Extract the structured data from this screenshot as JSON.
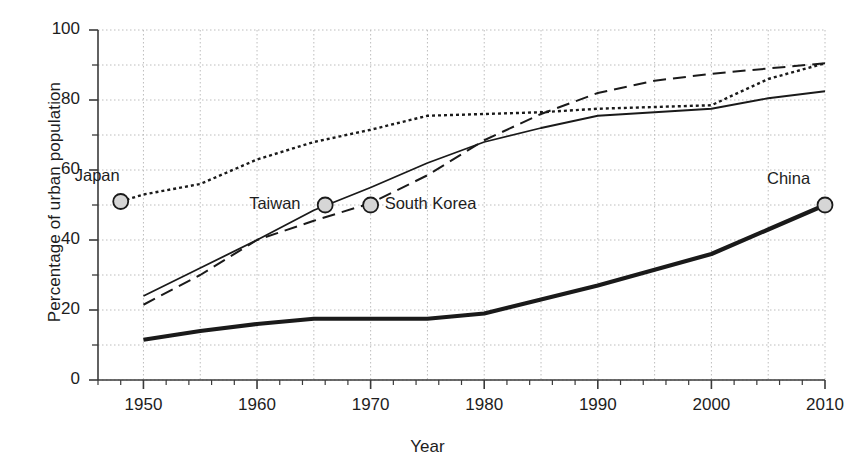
{
  "chart_data": {
    "type": "line",
    "title": "",
    "xlabel": "Year",
    "ylabel": "Percentage of urban population",
    "xlim": [
      1946,
      2010
    ],
    "ylim": [
      0,
      100
    ],
    "grid": true,
    "legend_position": "inline-labels",
    "x_major_ticks": [
      1950,
      1960,
      1970,
      1980,
      1990,
      2000,
      2010
    ],
    "x_tick_labels": [
      "1950",
      "1960",
      "1970",
      "1980",
      "1990",
      "2000",
      "2010"
    ],
    "x_minor_tick_step": 2,
    "y_major_ticks": [
      0,
      20,
      40,
      60,
      80,
      100
    ],
    "y_tick_labels": [
      "0",
      "20",
      "40",
      "60",
      "80",
      "100"
    ],
    "y_minor_ticks": [
      10,
      30,
      50,
      70,
      90
    ],
    "gridline_x_step": 5,
    "gridline_y_step": 10,
    "series": [
      {
        "name": "Japan",
        "style": "dotted",
        "marker_year": 1948,
        "marker_value": 51,
        "label": "Japan",
        "x": [
          1948,
          1950,
          1955,
          1960,
          1965,
          1970,
          1975,
          1980,
          1985,
          1990,
          1995,
          2000,
          2005,
          2010
        ],
        "values": [
          51,
          53,
          56,
          63,
          68,
          71.5,
          75.5,
          76,
          76.5,
          77.5,
          78,
          78.5,
          86,
          90.5
        ]
      },
      {
        "name": "Taiwan",
        "style": "solid",
        "marker_year": 1966,
        "marker_value": 50,
        "label": "Taiwan",
        "x": [
          1950,
          1955,
          1960,
          1965,
          1970,
          1975,
          1980,
          1985,
          1990,
          1995,
          2000,
          2005,
          2010
        ],
        "values": [
          24,
          32,
          40,
          48.5,
          55,
          62,
          68,
          72,
          75.5,
          76.5,
          77.5,
          80.5,
          82.5
        ]
      },
      {
        "name": "South Korea",
        "style": "dashed",
        "marker_year": 1970,
        "marker_value": 50,
        "label": "South Korea",
        "x": [
          1950,
          1955,
          1960,
          1965,
          1970,
          1975,
          1980,
          1985,
          1990,
          1995,
          2000,
          2005,
          2010
        ],
        "values": [
          21.5,
          30,
          40,
          45.5,
          50.5,
          58.5,
          68.5,
          76,
          82,
          85.5,
          87.5,
          89,
          90.5
        ]
      },
      {
        "name": "China",
        "style": "thick-solid",
        "marker_year": 2010,
        "marker_value": 50,
        "label": "China",
        "x": [
          1950,
          1955,
          1960,
          1965,
          1970,
          1975,
          1980,
          1985,
          1990,
          1995,
          2000,
          2005,
          2010
        ],
        "values": [
          11.5,
          14,
          16,
          17.5,
          17.5,
          17.5,
          19,
          23,
          27,
          31.5,
          36,
          43,
          50
        ]
      }
    ],
    "annotations": [
      {
        "text": "Japan",
        "year": 1948,
        "value": 51,
        "anchor": "above-left"
      },
      {
        "text": "Taiwan",
        "year": 1966,
        "value": 50,
        "anchor": "left"
      },
      {
        "text": "South Korea",
        "year": 1970,
        "value": 50,
        "anchor": "right"
      },
      {
        "text": "China",
        "year": 2010,
        "value": 50,
        "anchor": "above-left"
      }
    ]
  },
  "colors": {
    "line": "#1a1a1a",
    "grid": "#bdbdbd",
    "axis": "#3a3a3a",
    "marker_fill": "#d6d6d6",
    "background": "#ffffff"
  }
}
